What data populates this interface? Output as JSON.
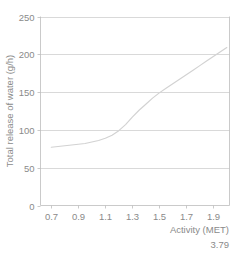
{
  "chart_data": {
    "type": "line",
    "title": "",
    "subtitle": "",
    "xlabel": "Activity (MET)",
    "ylabel": "Total release of water (g/h)",
    "xlim": [
      0.62,
      2.02
    ],
    "ylim": [
      0,
      250
    ],
    "grid": true,
    "grid_axis": "y",
    "legend": false,
    "legend_position": "none",
    "x_ticks": [
      0.7,
      0.9,
      1.1,
      1.3,
      1.5,
      1.7,
      1.9
    ],
    "x_tick_labels": [
      "0.7",
      "0.9",
      "1.1",
      "1.3",
      "1.5",
      "1.7",
      "1.9"
    ],
    "y_ticks": [
      0,
      50,
      100,
      150,
      200,
      250
    ],
    "y_tick_labels": [
      "0",
      "50",
      "100",
      "150",
      "200",
      "250"
    ],
    "annotations": [
      {
        "name": "corner-value",
        "text": "3.79"
      }
    ],
    "series": [
      {
        "name": "Total release of water",
        "color": "#d2d2d2",
        "x": [
          0.7,
          0.75,
          0.8,
          0.85,
          0.9,
          0.95,
          1.0,
          1.05,
          1.1,
          1.15,
          1.2,
          1.25,
          1.3,
          1.35,
          1.4,
          1.45,
          1.5,
          1.55,
          1.6,
          1.65,
          1.7,
          1.75,
          1.8,
          1.85,
          1.9,
          1.95,
          2.0
        ],
        "values": [
          77,
          78,
          79,
          80,
          81,
          82,
          84,
          86,
          89,
          93,
          99,
          107,
          117,
          126,
          134,
          142,
          149,
          155,
          161,
          167,
          173,
          179,
          185,
          191,
          197,
          203,
          209
        ]
      }
    ]
  },
  "axis_labels": {
    "x_title": "Activity (MET)",
    "y_title": "Total release of water (g/h)"
  },
  "footer": {
    "value": "3.79"
  },
  "colors": {
    "series": "#d2d2d2",
    "grid": "#c8c8c8",
    "frame": "#bdbdbd",
    "text": "#8a8a8a",
    "background": "#ffffff"
  }
}
